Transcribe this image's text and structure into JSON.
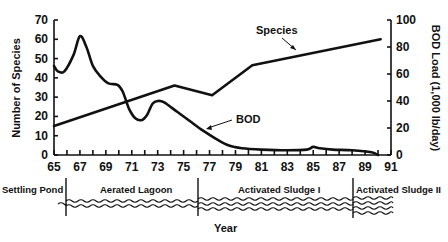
{
  "chart_data": {
    "type": "line",
    "title": "",
    "xlabel": "Year",
    "ylabel": "Number of Species",
    "ylabel_right": "BOD Load (1,000 lb/day)",
    "xlim": [
      65,
      91
    ],
    "ylim": [
      0,
      70
    ],
    "ylim_right": [
      0,
      100
    ],
    "x_ticks": [
      65,
      67,
      69,
      71,
      73,
      75,
      77,
      79,
      81,
      83,
      85,
      87,
      89,
      91
    ],
    "y_ticks": [
      0,
      10,
      20,
      30,
      40,
      50,
      60,
      70
    ],
    "y_ticks_right": [
      0,
      20,
      40,
      60,
      80,
      100
    ],
    "grid": false,
    "series": [
      {
        "name": "Species",
        "axis": "left",
        "x": [
          65,
          74.3,
          77.2,
          80.3,
          90.2
        ],
        "values": [
          15,
          36,
          31,
          46.5,
          60
        ]
      },
      {
        "name": "BOD",
        "axis": "right",
        "x": [
          65,
          65.3,
          65.8,
          66.5,
          67,
          67.5,
          68,
          68.6,
          69.2,
          69.9,
          70.3,
          70.8,
          71.3,
          71.8,
          72.2,
          72.6,
          73,
          73.5,
          74.5,
          75.5,
          76.5,
          77.5,
          78.5,
          79.5,
          81,
          83,
          84.5,
          85,
          85.5,
          86.5,
          88,
          89.5,
          90
        ],
        "values": [
          66,
          62,
          62,
          74,
          88,
          80,
          66,
          58,
          53,
          52,
          47,
          34,
          27,
          26,
          30,
          38,
          40,
          39,
          32,
          25,
          18,
          12,
          7,
          5,
          4,
          3.5,
          4,
          6,
          5,
          4,
          3.5,
          2,
          0
        ]
      }
    ],
    "annotations": [
      {
        "text": "Species",
        "arrow_to_series": "Species"
      },
      {
        "text": "BOD",
        "arrow_to_series": "BOD"
      }
    ],
    "process_phases": [
      {
        "label": "Settling Pond",
        "start": 64,
        "end": 66
      },
      {
        "label": "Aerated Lagoon",
        "start": 66,
        "end": 76.5
      },
      {
        "label": "Activated Sludge I",
        "start": 76.5,
        "end": 89
      },
      {
        "label": "Activated Sludge II",
        "start": 89,
        "end": 92
      }
    ]
  },
  "labels": {
    "species_annotation": "Species",
    "bod_annotation": "BOD",
    "x_title": "Year",
    "y_title_left": "Number of Species",
    "y_title_right": "BOD Load (1,000 lb/day)",
    "phase_settling": "Settling Pond",
    "phase_lagoon": "Aerated Lagoon",
    "phase_sludge1": "Activated Sludge I",
    "phase_sludge2": "Activated Sludge II"
  }
}
